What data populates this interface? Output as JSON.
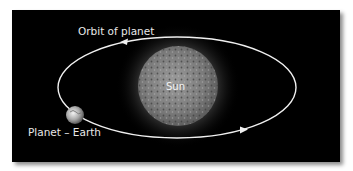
{
  "diagram": {
    "labels": {
      "orbit": "Orbit of planet",
      "sun": "Sun",
      "planet": "Planet – Earth"
    },
    "colors": {
      "background": "#000000",
      "orbit_line": "#f0f0f0",
      "label_text": "#e8e8e8"
    }
  }
}
